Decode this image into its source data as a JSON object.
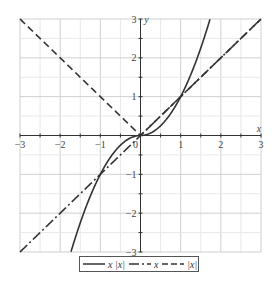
{
  "chart_data": {
    "type": "line",
    "title": "",
    "xlabel": "x",
    "ylabel": "y",
    "xlim": [
      -3,
      3
    ],
    "ylim": [
      -3,
      3
    ],
    "grid": true,
    "x_ticks": [
      "-3",
      "-2",
      "-1",
      "0",
      "1",
      "2",
      "3"
    ],
    "y_ticks": [
      "-3",
      "-2",
      "-1",
      "1",
      "2",
      "3"
    ],
    "legend_position": "bottom",
    "series": [
      {
        "name": "x|x|",
        "style": "solid",
        "function": "x*abs(x)",
        "x": [
          -1.73,
          -1.5,
          -1,
          -0.5,
          0,
          0.5,
          1,
          1.5,
          1.73
        ],
        "values": [
          -3,
          -2.25,
          -1,
          -0.25,
          0,
          0.25,
          1,
          2.25,
          3
        ]
      },
      {
        "name": "x",
        "style": "dash-dot",
        "function": "x",
        "x": [
          -3,
          -2,
          -1,
          0,
          1,
          2,
          3
        ],
        "values": [
          -3,
          -2,
          -1,
          0,
          1,
          2,
          3
        ]
      },
      {
        "name": "|x|",
        "style": "dashed",
        "function": "abs(x)",
        "x": [
          -3,
          -2,
          -1,
          0,
          1,
          2,
          3
        ],
        "values": [
          3,
          2,
          1,
          0,
          1,
          2,
          3
        ]
      }
    ]
  },
  "legend": {
    "items": [
      {
        "label": "x |x|"
      },
      {
        "label": "x"
      },
      {
        "label": "|x|"
      }
    ]
  },
  "colors": {
    "line": "#333333",
    "grid_major": "#cfcfcf",
    "grid_minor": "#e8e8e8",
    "axis": "#333333"
  }
}
